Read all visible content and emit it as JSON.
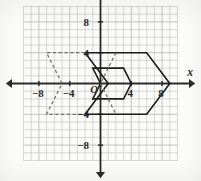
{
  "figure": {
    "kind": "coordinate-plane",
    "background_color": "#fbfbf9",
    "grid_color": "#b9b9b5",
    "axis_color": "#2a2a2a",
    "shape_color": "#1c1c1c",
    "dashed_color": "#6e6e6e"
  },
  "axes": {
    "x_label": "x",
    "y_label": "y",
    "origin_label": "O",
    "x_min": -10,
    "x_max": 10,
    "y_min": -10,
    "y_max": 10,
    "tick_step": 1,
    "label_step": 4,
    "x_tick_labels": [
      {
        "value": -8,
        "text": "−8"
      },
      {
        "value": -4,
        "text": "−4"
      },
      {
        "value": 4,
        "text": "4"
      },
      {
        "value": 8,
        "text": "8"
      }
    ],
    "y_tick_labels": [
      {
        "value": 8,
        "text": "8"
      },
      {
        "value": 4,
        "text": "4"
      },
      {
        "value": -4,
        "text": "−4"
      },
      {
        "value": -8,
        "text": "−8"
      }
    ]
  },
  "chart_data": {
    "type": "scatter",
    "title": "",
    "xlabel": "x",
    "ylabel": "y",
    "xlim": [
      -10,
      10
    ],
    "ylim": [
      -10,
      10
    ],
    "grid": true,
    "legend": null,
    "series": [
      {
        "name": "large-chevron-image",
        "style": "solid",
        "closed": true,
        "points": [
          [
            -2,
            4
          ],
          [
            6,
            4
          ],
          [
            9,
            0
          ],
          [
            6,
            -4
          ],
          [
            -2,
            -4
          ],
          [
            1,
            0
          ]
        ]
      },
      {
        "name": "small-chevron-image",
        "style": "solid",
        "closed": true,
        "points": [
          [
            -1,
            2
          ],
          [
            3,
            2
          ],
          [
            4,
            0
          ],
          [
            3,
            -2
          ],
          [
            -1,
            -2
          ],
          [
            0,
            0
          ]
        ]
      },
      {
        "name": "dashed-preimage",
        "style": "dashed",
        "closed": false,
        "points": [
          [
            -2,
            4
          ],
          [
            -7,
            4
          ],
          [
            -5,
            0
          ],
          [
            -7,
            -4
          ],
          [
            -2,
            -4
          ]
        ]
      },
      {
        "name": "dashed-interior-diagonal",
        "style": "dashed",
        "closed": false,
        "points": [
          [
            2,
            4
          ],
          [
            0,
            0
          ],
          [
            2,
            -4
          ]
        ]
      }
    ]
  }
}
